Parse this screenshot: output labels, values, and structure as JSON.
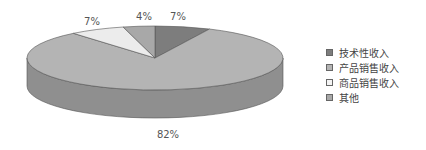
{
  "chart_data": {
    "type": "pie",
    "style": "3d",
    "title": "",
    "categories": [
      "技术性收入",
      "产品销售收入",
      "商品销售收入",
      "其他"
    ],
    "values": [
      7,
      82,
      7,
      4
    ],
    "labels": [
      "7%",
      "82%",
      "7%",
      "4%"
    ],
    "colors": [
      "#7d7d7d",
      "#b4b4b4",
      "#ececec",
      "#a8a8a8"
    ],
    "side_colors": [
      "#5e5e5e",
      "#8f8f8f",
      "#c8c8c8",
      "#888888"
    ],
    "legend_position": "right"
  },
  "legend": {
    "items": [
      {
        "label": "技术性收入",
        "color": "#7d7d7d"
      },
      {
        "label": "产品销售收入",
        "color": "#b4b4b4"
      },
      {
        "label": "商品销售收入",
        "color": "#f4f4f4"
      },
      {
        "label": "其他",
        "color": "#a8a8a8"
      }
    ]
  }
}
